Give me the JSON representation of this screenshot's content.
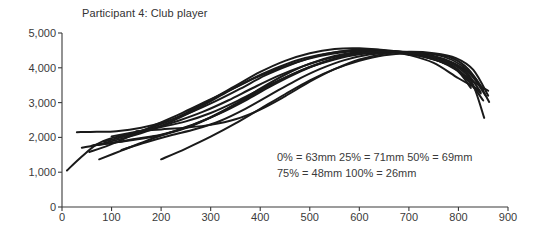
{
  "chart_data": {
    "type": "line",
    "title": "Participant 4: Club player",
    "subtitle": "",
    "xlabel": "",
    "ylabel": "",
    "xlim": [
      0,
      900
    ],
    "ylim": [
      0,
      5000
    ],
    "grid": false,
    "legend_position": "none",
    "x_ticks": [
      0,
      100,
      200,
      300,
      400,
      500,
      600,
      700,
      800,
      900
    ],
    "x_tick_labels": [
      "0",
      "100",
      "200",
      "300",
      "400",
      "500",
      "600",
      "700",
      "800",
      "900"
    ],
    "y_ticks": [
      0,
      1000,
      2000,
      3000,
      4000,
      5000
    ],
    "y_tick_labels": [
      "0",
      "1,000",
      "2,000",
      "3,000",
      "4,000",
      "5,000"
    ],
    "line_color": "#1a1a1a",
    "line_width": 2.0,
    "annotations": [
      "0% = 63mm  25% = 71mm  50% = 69mm",
      "75% = 48mm  100% = 26mm"
    ],
    "annotation_values": [
      {
        "percent": "0%",
        "value": 63,
        "unit": "mm"
      },
      {
        "percent": "25%",
        "value": 71,
        "unit": "mm"
      },
      {
        "percent": "50%",
        "value": 69,
        "unit": "mm"
      },
      {
        "percent": "75%",
        "value": 48,
        "unit": "mm"
      },
      {
        "percent": "100%",
        "value": 26,
        "unit": "mm"
      }
    ],
    "series": [
      {
        "name": "trial-1",
        "x": [
          10,
          40,
          70,
          100,
          150,
          200,
          250,
          300,
          350,
          400,
          450,
          500,
          550,
          600,
          650,
          700,
          750,
          800,
          840
        ],
        "y": [
          1050,
          1450,
          1800,
          1980,
          2150,
          2380,
          2700,
          3080,
          3480,
          3880,
          4200,
          4420,
          4540,
          4560,
          4500,
          4370,
          4140,
          3700,
          3380
        ]
      },
      {
        "name": "trial-2",
        "x": [
          30,
          70,
          110,
          160,
          210,
          260,
          310,
          360,
          410,
          460,
          510,
          560,
          610,
          660,
          710,
          760,
          800,
          830,
          860
        ],
        "y": [
          2150,
          2160,
          2180,
          2280,
          2460,
          2720,
          3040,
          3400,
          3780,
          4080,
          4320,
          4470,
          4530,
          4500,
          4400,
          4200,
          3900,
          3600,
          3340
        ]
      },
      {
        "name": "trial-3",
        "x": [
          40,
          80,
          130,
          180,
          230,
          280,
          330,
          380,
          430,
          480,
          530,
          580,
          630,
          680,
          730,
          780,
          810,
          845
        ],
        "y": [
          1700,
          1820,
          2000,
          2220,
          2520,
          2880,
          3280,
          3660,
          3980,
          4240,
          4400,
          4490,
          4500,
          4440,
          4320,
          4100,
          3760,
          3260
        ]
      },
      {
        "name": "trial-4",
        "x": [
          55,
          95,
          145,
          195,
          245,
          295,
          345,
          395,
          445,
          495,
          545,
          595,
          645,
          695,
          745,
          790,
          820,
          850
        ],
        "y": [
          1580,
          1780,
          2080,
          2400,
          2720,
          3060,
          3400,
          3740,
          4020,
          4250,
          4400,
          4480,
          4470,
          4400,
          4260,
          4020,
          3640,
          3060
        ]
      },
      {
        "name": "trial-5",
        "x": [
          75,
          120,
          170,
          220,
          270,
          320,
          370,
          420,
          470,
          520,
          570,
          620,
          670,
          720,
          770,
          805,
          835
        ],
        "y": [
          1370,
          1620,
          1900,
          2150,
          2400,
          2700,
          3060,
          3460,
          3820,
          4120,
          4340,
          4460,
          4480,
          4400,
          4200,
          3880,
          3360
        ]
      },
      {
        "name": "trial-6",
        "x": [
          60,
          100,
          150,
          200,
          250,
          300,
          350,
          400,
          450,
          500,
          550,
          600,
          650,
          700,
          750,
          795,
          825
        ],
        "y": [
          1760,
          1840,
          1960,
          2080,
          2280,
          2580,
          2960,
          3400,
          3800,
          4120,
          4340,
          4460,
          4480,
          4420,
          4250,
          3960,
          3420
        ]
      },
      {
        "name": "trial-7",
        "x": [
          85,
          135,
          185,
          235,
          285,
          335,
          385,
          435,
          485,
          535,
          585,
          635,
          685,
          735,
          780,
          815,
          845
        ],
        "y": [
          1880,
          2060,
          2260,
          2480,
          2740,
          3060,
          3420,
          3760,
          4040,
          4260,
          4400,
          4460,
          4450,
          4360,
          4180,
          3880,
          3300
        ]
      },
      {
        "name": "trial-8",
        "x": [
          100,
          150,
          200,
          250,
          300,
          350,
          400,
          450,
          500,
          550,
          600,
          650,
          700,
          750,
          790,
          825,
          855
        ],
        "y": [
          2030,
          2160,
          2300,
          2460,
          2700,
          3020,
          3380,
          3720,
          4020,
          4240,
          4390,
          4450,
          4440,
          4340,
          4140,
          3800,
          3200
        ]
      },
      {
        "name": "trial-9",
        "x": [
          120,
          170,
          220,
          270,
          320,
          370,
          420,
          470,
          520,
          570,
          620,
          670,
          720,
          770,
          805,
          835,
          862
        ],
        "y": [
          1640,
          1860,
          2060,
          2240,
          2480,
          2820,
          3220,
          3620,
          3960,
          4220,
          4380,
          4450,
          4440,
          4320,
          4080,
          3680,
          3020
        ]
      },
      {
        "name": "trial-10",
        "x": [
          200,
          250,
          300,
          350,
          400,
          450,
          500,
          550,
          600,
          650,
          700,
          750,
          790,
          820,
          850
        ],
        "y": [
          1370,
          1680,
          2020,
          2400,
          2820,
          3240,
          3640,
          3960,
          4200,
          4360,
          4420,
          4400,
          4260,
          3960,
          3380
        ]
      },
      {
        "name": "trial-11",
        "x": [
          150,
          200,
          250,
          300,
          350,
          400,
          450,
          500,
          550,
          600,
          650,
          700,
          750,
          795,
          830,
          860
        ],
        "y": [
          2180,
          2230,
          2280,
          2360,
          2520,
          2800,
          3180,
          3600,
          3960,
          4240,
          4400,
          4460,
          4420,
          4280,
          3940,
          3200
        ]
      },
      {
        "name": "trial-12",
        "x": [
          65,
          110,
          160,
          210,
          260,
          310,
          360,
          410,
          460,
          510,
          560,
          610,
          660,
          710,
          760,
          800,
          828,
          852
        ],
        "y": [
          1780,
          1860,
          1960,
          2100,
          2320,
          2640,
          3020,
          3420,
          3780,
          4080,
          4300,
          4430,
          4470,
          4420,
          4270,
          4000,
          3560,
          2560
        ]
      }
    ]
  }
}
